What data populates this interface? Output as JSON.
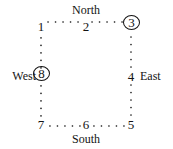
{
  "diagram": {
    "type": "cycle-graph",
    "background_color": "#ffffff",
    "ink_color": "#131313",
    "edge_style": "dotted",
    "compass": {
      "north": "North",
      "south": "South",
      "east": "East",
      "west": "West"
    },
    "nodes": [
      {
        "id": "n1",
        "label": "1",
        "position": "top-left",
        "circled": false,
        "x": 41,
        "y": 26
      },
      {
        "id": "n2",
        "label": "2",
        "position": "top-center",
        "circled": false,
        "x": 86,
        "y": 26
      },
      {
        "id": "n3",
        "label": "3",
        "position": "top-right",
        "circled": true,
        "x": 131,
        "y": 26
      },
      {
        "id": "n4",
        "label": "4",
        "position": "right-center",
        "circled": false,
        "x": 131,
        "y": 76
      },
      {
        "id": "n5",
        "label": "5",
        "position": "bottom-right",
        "circled": false,
        "x": 131,
        "y": 124
      },
      {
        "id": "n6",
        "label": "6",
        "position": "bottom-center",
        "circled": false,
        "x": 86,
        "y": 124
      },
      {
        "id": "n7",
        "label": "7",
        "position": "bottom-left",
        "circled": false,
        "x": 41,
        "y": 124
      },
      {
        "id": "n8",
        "label": "8",
        "position": "left-center",
        "circled": true,
        "x": 41,
        "y": 76
      }
    ],
    "edges": [
      {
        "from": "n1",
        "to": "n2"
      },
      {
        "from": "n2",
        "to": "n3"
      },
      {
        "from": "n3",
        "to": "n4"
      },
      {
        "from": "n4",
        "to": "n5"
      },
      {
        "from": "n5",
        "to": "n6"
      },
      {
        "from": "n6",
        "to": "n7"
      },
      {
        "from": "n7",
        "to": "n8"
      },
      {
        "from": "n8",
        "to": "n1"
      }
    ]
  }
}
